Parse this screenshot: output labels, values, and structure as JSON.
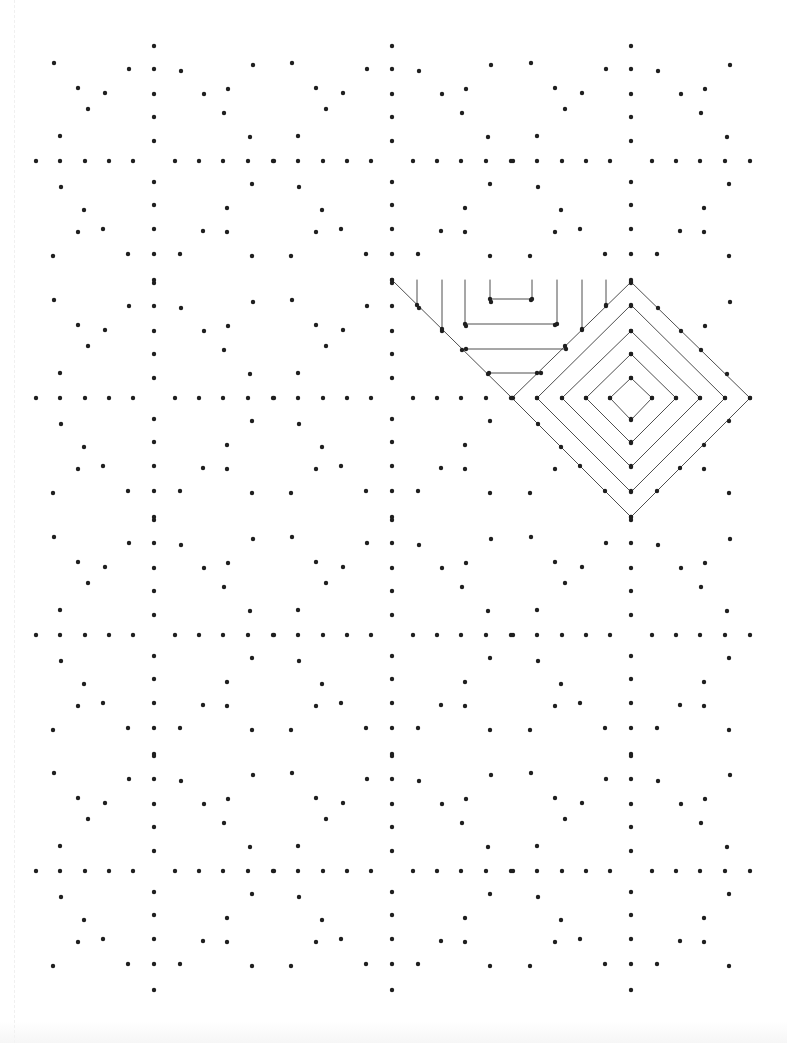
{
  "page": {
    "title": "Dot grid drawing worksheet",
    "width": 787,
    "height": 1043,
    "background": "#ffffff",
    "dot_color": "#1f1f1f",
    "line_color": "#3a3a3a",
    "dot_radius": 2.2,
    "line_width": 0.9
  },
  "dot_grid": {
    "tile_size": 238,
    "tile_centers_x": [
      154,
      392,
      631
    ],
    "tile_centers_y": [
      161,
      398,
      635,
      871
    ],
    "tile_pattern": [
      [
        0,
        -115
      ],
      [
        0,
        -92
      ],
      [
        0,
        -67
      ],
      [
        0,
        -44
      ],
      [
        0,
        -20
      ],
      [
        0,
        21
      ],
      [
        0,
        44
      ],
      [
        0,
        68
      ],
      [
        0,
        93
      ],
      [
        0,
        119
      ],
      [
        -118,
        0
      ],
      [
        -94,
        0
      ],
      [
        -69,
        0
      ],
      [
        -45,
        0
      ],
      [
        -21,
        0
      ],
      [
        21,
        0
      ],
      [
        45,
        0
      ],
      [
        69,
        0
      ],
      [
        94,
        0
      ],
      [
        119,
        0
      ],
      [
        -100,
        -98
      ],
      [
        -25,
        -92
      ],
      [
        -76,
        -73
      ],
      [
        -49,
        -68
      ],
      [
        -66,
        -52
      ],
      [
        -94,
        -25
      ],
      [
        27,
        -90
      ],
      [
        99,
        -96
      ],
      [
        50,
        -67
      ],
      [
        74,
        -72
      ],
      [
        70,
        -48
      ],
      [
        96,
        -24
      ],
      [
        -93,
        26
      ],
      [
        -70,
        49
      ],
      [
        -76,
        71
      ],
      [
        -51,
        68
      ],
      [
        -101,
        95
      ],
      [
        -26,
        93
      ],
      [
        98,
        23
      ],
      [
        73,
        47
      ],
      [
        49,
        70
      ],
      [
        73,
        71
      ],
      [
        26,
        93
      ],
      [
        98,
        95
      ]
    ]
  },
  "example_drawing": {
    "label": "Completed example pattern",
    "lines": [
      [
        392,
        280,
        512,
        398
      ],
      [
        512,
        398,
        631,
        517
      ],
      [
        417,
        280,
        417,
        305
      ],
      [
        442,
        280,
        442,
        329
      ],
      [
        465,
        280,
        465,
        324
      ],
      [
        465,
        324,
        557,
        324
      ],
      [
        557,
        324,
        557,
        280
      ],
      [
        490,
        280,
        490,
        299
      ],
      [
        490,
        299,
        532,
        299
      ],
      [
        532,
        299,
        532,
        280
      ],
      [
        466,
        349,
        566,
        349
      ],
      [
        489,
        373,
        541,
        373
      ],
      [
        582,
        280,
        582,
        329
      ],
      [
        606,
        280,
        606,
        305
      ],
      [
        512,
        398,
        631,
        282
      ],
      [
        631,
        282,
        750,
        398
      ],
      [
        750,
        398,
        631,
        517
      ],
      [
        537,
        398,
        631,
        305
      ],
      [
        631,
        305,
        725,
        398
      ],
      [
        725,
        398,
        631,
        492
      ],
      [
        631,
        492,
        537,
        398
      ],
      [
        562,
        398,
        631,
        331
      ],
      [
        631,
        331,
        700,
        398
      ],
      [
        700,
        398,
        631,
        467
      ],
      [
        631,
        467,
        562,
        398
      ],
      [
        586,
        398,
        631,
        354
      ],
      [
        631,
        354,
        676,
        398
      ],
      [
        676,
        398,
        631,
        443
      ],
      [
        631,
        443,
        586,
        398
      ],
      [
        610,
        398,
        631,
        378
      ],
      [
        631,
        378,
        652,
        398
      ],
      [
        652,
        398,
        631,
        420
      ],
      [
        631,
        420,
        610,
        398
      ]
    ],
    "extra_dots": [
      [
        392,
        280
      ],
      [
        417,
        305
      ],
      [
        442,
        329
      ],
      [
        465,
        324
      ],
      [
        557,
        324
      ],
      [
        490,
        299
      ],
      [
        532,
        299
      ],
      [
        466,
        349
      ],
      [
        566,
        349
      ],
      [
        489,
        373
      ],
      [
        541,
        373
      ],
      [
        512,
        398
      ],
      [
        582,
        329
      ],
      [
        606,
        305
      ],
      [
        631,
        282
      ],
      [
        750,
        398
      ],
      [
        631,
        517
      ],
      [
        631,
        305
      ],
      [
        725,
        398
      ],
      [
        631,
        492
      ],
      [
        537,
        398
      ],
      [
        631,
        331
      ],
      [
        700,
        398
      ],
      [
        631,
        467
      ],
      [
        562,
        398
      ],
      [
        631,
        354
      ],
      [
        676,
        398
      ],
      [
        631,
        443
      ],
      [
        586,
        398
      ],
      [
        631,
        378
      ],
      [
        652,
        398
      ],
      [
        631,
        420
      ],
      [
        610,
        398
      ]
    ]
  }
}
